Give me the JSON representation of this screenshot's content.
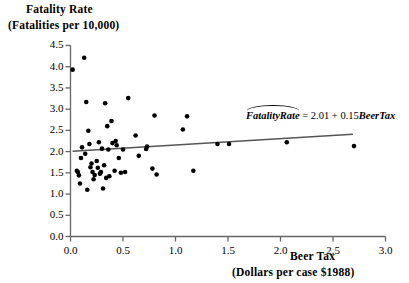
{
  "chart_data": {
    "type": "scatter",
    "title": "",
    "ylabel_line1": "Fatality Rate",
    "ylabel_line2": "(Fatalities per 10,000)",
    "xlabel_line1": "Beer Tax",
    "xlabel_line2": "(Dollars per case $1988)",
    "xlim": [
      0.0,
      3.0
    ],
    "ylim": [
      0.0,
      4.5
    ],
    "grid": false,
    "legend": "none",
    "xticks": [
      "0.0",
      "0.5",
      "1.0",
      "1.5",
      "2.0",
      "2.5",
      "3.0"
    ],
    "xtick_values": [
      0.0,
      0.5,
      1.0,
      1.5,
      2.0,
      2.5,
      3.0
    ],
    "yticks": [
      "0.0",
      "0.5",
      "1.0",
      "1.5",
      "2.0",
      "2.5",
      "3.0",
      "3.5",
      "4.0",
      "4.5"
    ],
    "ytick_values": [
      0.0,
      0.5,
      1.0,
      1.5,
      2.0,
      2.5,
      3.0,
      3.5,
      4.0,
      4.5
    ],
    "point_color": "#000000",
    "line_color": "#555555",
    "axis_color": "#666666",
    "annotation": {
      "text": "FatalityRate = 2.01 + 0.15BeerTax",
      "hat_over": "FatalityRate",
      "dependent": "FatalityRate",
      "independent": "BeerTax",
      "intercept": 2.01,
      "slope": 0.15,
      "x": 2.4,
      "y": 2.55
    },
    "fit_line": {
      "type": "ols",
      "intercept": 2.01,
      "slope": 0.15,
      "x_start": 0.02,
      "x_end": 2.69,
      "y_start": 2.01,
      "y_end": 2.41
    },
    "x": [
      0.02,
      0.06,
      0.07,
      0.08,
      0.09,
      0.1,
      0.11,
      0.13,
      0.14,
      0.15,
      0.16,
      0.17,
      0.18,
      0.19,
      0.2,
      0.21,
      0.22,
      0.23,
      0.25,
      0.26,
      0.27,
      0.28,
      0.29,
      0.3,
      0.31,
      0.32,
      0.33,
      0.34,
      0.35,
      0.36,
      0.37,
      0.39,
      0.4,
      0.42,
      0.43,
      0.44,
      0.46,
      0.48,
      0.5,
      0.52,
      0.55,
      0.62,
      0.65,
      0.72,
      0.73,
      0.78,
      0.8,
      0.82,
      1.07,
      1.11,
      1.17,
      1.4,
      1.51,
      2.06,
      2.7
    ],
    "y": [
      3.93,
      1.55,
      1.52,
      1.44,
      1.25,
      1.85,
      2.1,
      4.21,
      1.95,
      3.17,
      1.1,
      2.49,
      2.18,
      1.63,
      1.72,
      1.52,
      1.35,
      1.45,
      1.78,
      1.62,
      2.22,
      1.48,
      1.52,
      2.07,
      1.13,
      1.68,
      3.14,
      1.38,
      2.6,
      2.05,
      1.42,
      2.72,
      2.2,
      1.55,
      2.25,
      2.15,
      1.85,
      1.5,
      2.05,
      1.52,
      3.26,
      2.38,
      1.9,
      2.06,
      2.12,
      1.6,
      2.85,
      1.46,
      2.52,
      2.83,
      1.55,
      2.18,
      2.18,
      2.22,
      2.13
    ]
  }
}
